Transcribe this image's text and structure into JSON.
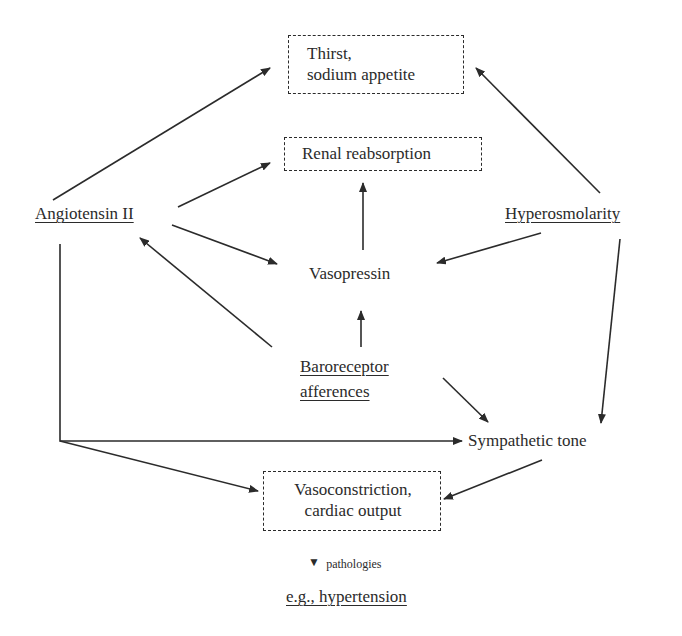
{
  "diagram": {
    "nodes": {
      "thirst": {
        "line1": "Thirst,",
        "line2": "sodium appetite",
        "style": "dashed-box"
      },
      "renal": {
        "label": "Renal reabsorption",
        "style": "dashed-box"
      },
      "angiotensin": {
        "label": "Angiotensin II",
        "style": "underlined"
      },
      "hyperosmolarity": {
        "label": "Hyperosmolarity",
        "style": "underlined"
      },
      "vasopressin": {
        "label": "Vasopressin",
        "style": "plain"
      },
      "baroreceptor": {
        "line1": "Baroreceptor",
        "line2": "afferences",
        "style": "underlined"
      },
      "sympathetic": {
        "label": "Sympathetic tone",
        "style": "plain"
      },
      "vasoconstriction": {
        "line1": "Vasoconstriction,",
        "line2": "cardiac output",
        "style": "dashed-box"
      },
      "pathologies": {
        "label": "pathologies",
        "marker": "▼"
      },
      "hypertension": {
        "label": "e.g., hypertension",
        "style": "underlined"
      }
    },
    "edges": [
      {
        "from": "Angiotensin II",
        "to": "Thirst, sodium appetite"
      },
      {
        "from": "Angiotensin II",
        "to": "Renal reabsorption"
      },
      {
        "from": "Angiotensin II",
        "to": "Vasopressin"
      },
      {
        "from": "Angiotensin II",
        "to": "Sympathetic tone"
      },
      {
        "from": "Angiotensin II",
        "to": "Vasoconstriction, cardiac output"
      },
      {
        "from": "Hyperosmolarity",
        "to": "Thirst, sodium appetite"
      },
      {
        "from": "Hyperosmolarity",
        "to": "Vasopressin"
      },
      {
        "from": "Hyperosmolarity",
        "to": "Sympathetic tone"
      },
      {
        "from": "Vasopressin",
        "to": "Renal reabsorption"
      },
      {
        "from": "Baroreceptor afferences",
        "to": "Vasopressin"
      },
      {
        "from": "Baroreceptor afferences",
        "to": "Angiotensin II"
      },
      {
        "from": "Baroreceptor afferences",
        "to": "Sympathetic tone"
      },
      {
        "from": "Sympathetic tone",
        "to": "Vasoconstriction, cardiac output"
      },
      {
        "from": "Vasoconstriction, cardiac output",
        "to": "e.g., hypertension",
        "label": "pathologies"
      }
    ],
    "colors": {
      "ink": "#2b2b2b",
      "background": "#ffffff"
    }
  }
}
